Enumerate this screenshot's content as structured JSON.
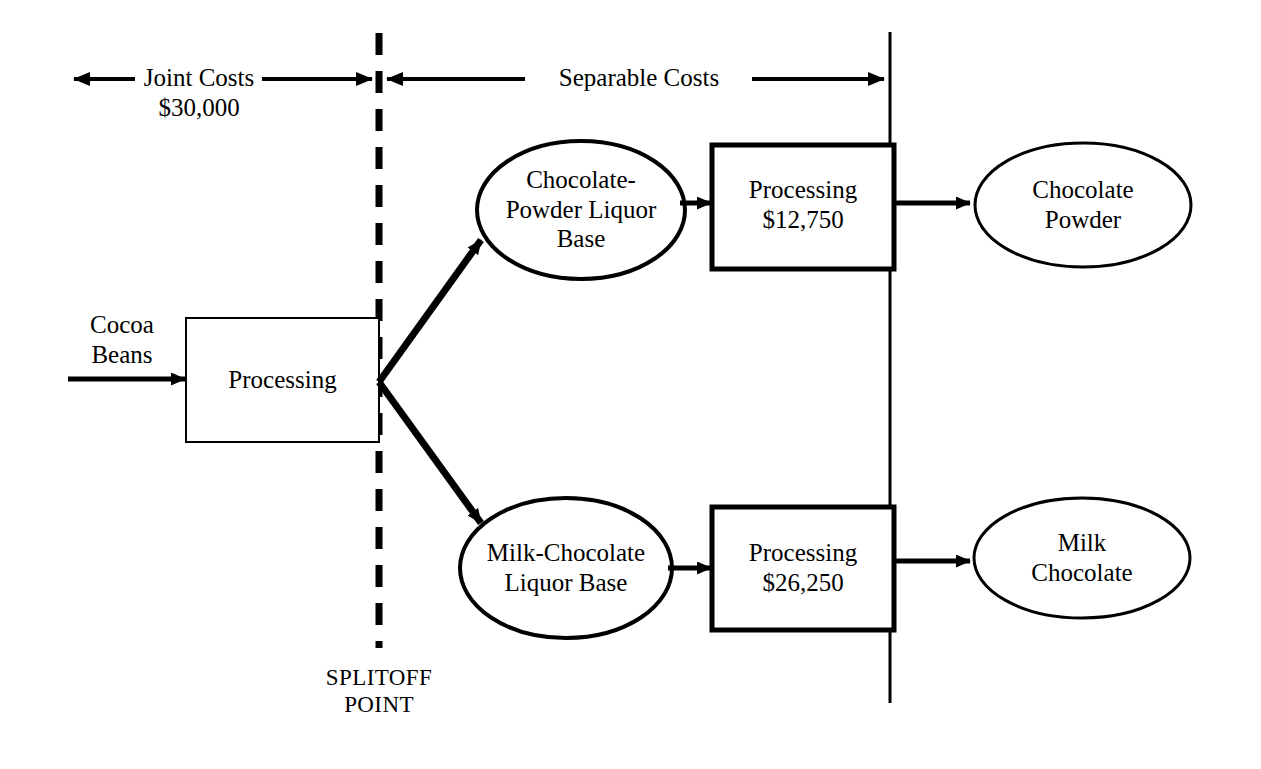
{
  "diagram": {
    "colors": {
      "line": "#000000",
      "background": "#ffffff",
      "text": "#000000"
    },
    "header": {
      "joint_costs_label": "Joint Costs\n$30,000",
      "joint_costs_name": "Joint Costs",
      "joint_costs_amount": "$30,000",
      "separable_costs_label": "Separable Costs"
    },
    "splitoff": {
      "label": "SPLITOFF\nPOINT",
      "line1": "SPLITOFF",
      "line2": "POINT"
    },
    "input": {
      "label": "Cocoa\nBeans",
      "line1": "Cocoa",
      "line2": "Beans"
    },
    "joint_process": {
      "label": "Processing"
    },
    "branches": [
      {
        "intermediate": {
          "label": "Chocolate-\nPowder Liquor\nBase",
          "line1": "Chocolate-",
          "line2": "Powder Liquor",
          "line3": "Base"
        },
        "process": {
          "label": "Processing\n$12,750",
          "name": "Processing",
          "amount": "$12,750"
        },
        "product": {
          "label": "Chocolate\nPowder",
          "line1": "Chocolate",
          "line2": "Powder"
        }
      },
      {
        "intermediate": {
          "label": "Milk-Chocolate\nLiquor Base",
          "line1": "Milk-Chocolate",
          "line2": "Liquor Base"
        },
        "process": {
          "label": "Processing\n$26,250",
          "name": "Processing",
          "amount": "$26,250"
        },
        "product": {
          "label": "Milk\nChocolate",
          "line1": "Milk",
          "line2": "Chocolate"
        }
      }
    ]
  }
}
